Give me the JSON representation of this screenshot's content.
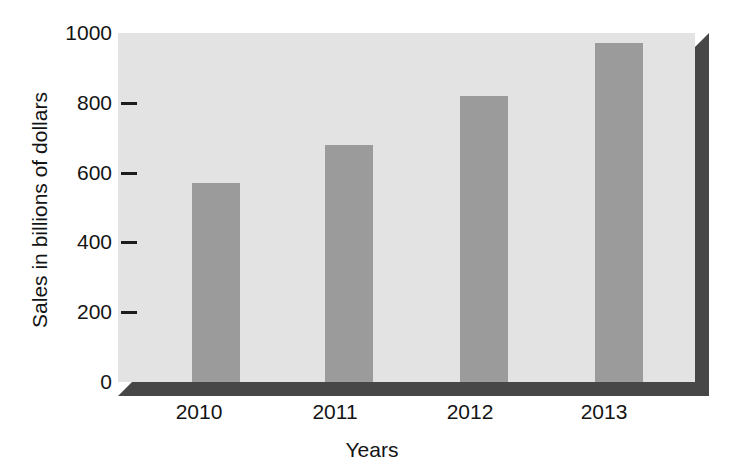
{
  "chart_data": {
    "type": "bar",
    "title": "",
    "xlabel": "Years",
    "ylabel": "Sales in billions of dollars",
    "categories": [
      "2010",
      "2011",
      "2012",
      "2013"
    ],
    "values": [
      570,
      680,
      820,
      970
    ],
    "ylim": [
      0,
      1000
    ],
    "xlim": null,
    "y_ticks": [
      0,
      200,
      400,
      600,
      800,
      1000
    ],
    "y_tick_labels": [
      "0",
      "200",
      "400",
      "600",
      "800",
      "1000"
    ],
    "x_tick_labels": [
      "2010",
      "2011",
      "2012",
      "2013"
    ],
    "grid": false,
    "legend": null,
    "legend_position": "none",
    "annotations": [],
    "series": [
      {
        "name": "Sales",
        "values": [
          570,
          680,
          820,
          970
        ]
      }
    ],
    "style": {
      "bar_color": "#9b9b9b",
      "plot_background": "#e3e3e3",
      "shadow_color": "#474747",
      "text_color": "#141414",
      "figure_background": "#ffffff",
      "three_d_effect": true
    },
    "bar_geometry": [
      {
        "category": "2010",
        "left_pct": 12.8,
        "width_pct": 8.3
      },
      {
        "category": "2011",
        "left_pct": 35.9,
        "width_pct": 8.3
      },
      {
        "category": "2012",
        "left_pct": 59.3,
        "width_pct": 8.3
      },
      {
        "category": "2013",
        "left_pct": 82.7,
        "width_pct": 8.3
      }
    ],
    "x_label_positions_px": [
      199,
      335,
      470,
      604
    ]
  }
}
